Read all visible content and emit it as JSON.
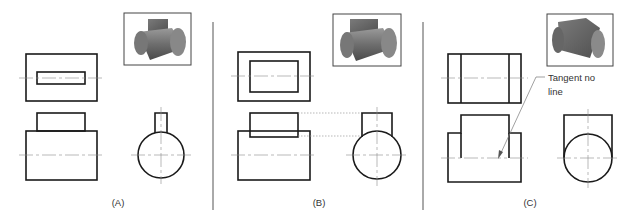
{
  "figure": {
    "panels": [
      {
        "id": "A",
        "label": "(A)",
        "thumbnail": "cylinder-with-narrow-tab"
      },
      {
        "id": "B",
        "label": "(B)",
        "thumbnail": "cylinder-with-wider-block"
      },
      {
        "id": "C",
        "label": "(C)",
        "thumbnail": "cylinder-with-tangent-block"
      }
    ],
    "callout": {
      "line1": "Tangent no",
      "line2": "line"
    }
  }
}
